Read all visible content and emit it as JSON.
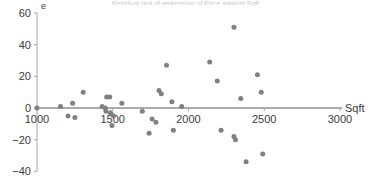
{
  "figure": {
    "title_partial": "Residual plot of regression of Price against Sqft",
    "background": "#ffffff",
    "point_color": "#808080",
    "axis_color": "#595959",
    "text_color": "#3b3b3b"
  },
  "chart_data": {
    "type": "scatter",
    "title": "",
    "xlabel": "Sqft",
    "ylabel": "e",
    "xlim": [
      1000,
      3000
    ],
    "ylim": [
      -40,
      60
    ],
    "xticks": [
      1000,
      1500,
      2000,
      2500,
      3000
    ],
    "yticks": [
      -40,
      -20,
      0,
      20,
      40,
      60
    ],
    "xtick_labels": [
      "1000",
      "1500",
      "2000",
      "2500",
      "3000"
    ],
    "ytick_labels": [
      "60",
      "40",
      "20",
      "0",
      "-20",
      "-40"
    ],
    "grid": false,
    "legend": null,
    "zero_line": 0,
    "marker": "circle",
    "marker_size": 3,
    "n_points": 41,
    "points": [
      {
        "x": 1000,
        "y": 0
      },
      {
        "x": 1155,
        "y": 1
      },
      {
        "x": 1205,
        "y": -5
      },
      {
        "x": 1235,
        "y": 3
      },
      {
        "x": 1250,
        "y": -6
      },
      {
        "x": 1305,
        "y": 10
      },
      {
        "x": 1430,
        "y": 1
      },
      {
        "x": 1450,
        "y": 0
      },
      {
        "x": 1455,
        "y": -2
      },
      {
        "x": 1460,
        "y": 7
      },
      {
        "x": 1480,
        "y": 7
      },
      {
        "x": 1485,
        "y": -3
      },
      {
        "x": 1490,
        "y": -4
      },
      {
        "x": 1495,
        "y": -11
      },
      {
        "x": 1505,
        "y": -5
      },
      {
        "x": 1560,
        "y": 3
      },
      {
        "x": 1695,
        "y": -2
      },
      {
        "x": 1740,
        "y": -16
      },
      {
        "x": 1760,
        "y": -7
      },
      {
        "x": 1785,
        "y": -9
      },
      {
        "x": 1805,
        "y": 11
      },
      {
        "x": 1820,
        "y": 9
      },
      {
        "x": 1855,
        "y": 27
      },
      {
        "x": 1890,
        "y": 4
      },
      {
        "x": 1900,
        "y": -14
      },
      {
        "x": 1955,
        "y": 1
      },
      {
        "x": 2140,
        "y": 29
      },
      {
        "x": 2190,
        "y": 17
      },
      {
        "x": 2215,
        "y": -14
      },
      {
        "x": 2300,
        "y": 51
      },
      {
        "x": 2300,
        "y": -18
      },
      {
        "x": 2310,
        "y": -20
      },
      {
        "x": 2345,
        "y": 6
      },
      {
        "x": 2380,
        "y": -34
      },
      {
        "x": 2455,
        "y": 21
      },
      {
        "x": 2480,
        "y": 10
      },
      {
        "x": 2490,
        "y": -29
      }
    ]
  }
}
